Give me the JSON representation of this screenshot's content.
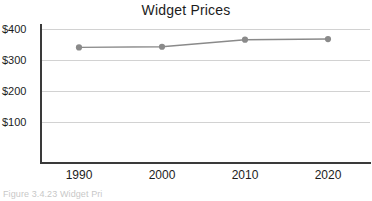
{
  "chart_data": {
    "type": "line",
    "title": "Widget Prices",
    "xlabel": "",
    "ylabel": "",
    "categories": [
      "1990",
      "2000",
      "2010",
      "2020"
    ],
    "x": [
      1990,
      2000,
      2010,
      2020
    ],
    "values": [
      345,
      347,
      368,
      370
    ],
    "series": [
      {
        "name": "Widget Prices",
        "values": [
          345,
          347,
          368,
          370
        ]
      }
    ],
    "ylim": [
      0,
      400
    ],
    "xlim": [
      1985,
      2025
    ],
    "y_ticks": [
      100,
      200,
      300,
      400
    ],
    "y_tick_labels": [
      "$100",
      "$200",
      "$300",
      "$400"
    ],
    "x_tick_labels": [
      "1990",
      "2000",
      "2010",
      "2020"
    ],
    "grid": true,
    "legend": false,
    "legend_position": "none",
    "colors": {
      "line": "#8a8a8a",
      "marker": "#8a8a8a",
      "grid": "#d2d2d2",
      "axis": "#3a3a3a",
      "text": "#1c1c1c",
      "background": "#ffffff"
    }
  },
  "caption": {
    "text": "Figure 3.4.23   Widget Pri"
  }
}
